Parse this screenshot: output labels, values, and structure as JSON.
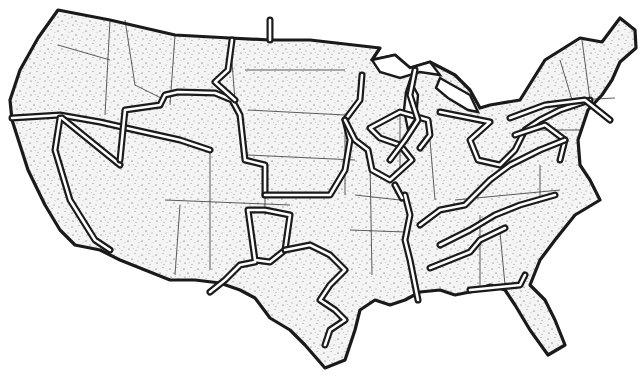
{
  "map": {
    "title": "",
    "style": "stippled black-and-white outline map",
    "subject": "contiguous United States with thick double-line regional boundaries",
    "colors": {
      "ink": "#1a1a1a",
      "paper": "#ffffff",
      "stipple": "#3a3a3a"
    },
    "width": 643,
    "height": 379,
    "states_outline": "M38 38 L58 10 L110 20 L175 35 L230 38 L270 40 L310 40 L380 48 L372 60 L395 55 L410 68 L430 62 L455 75 L470 90 L480 108 L490 105 L520 100 L545 60 L580 38 L602 42 L620 18 L635 30 L636 48 L620 62 L612 80 L602 95 L588 110 L578 140 L580 165 L590 180 L600 200 L575 215 L555 240 L540 260 L530 285 L545 300 L555 320 L565 345 L548 355 L530 330 L515 305 L505 290 L490 285 L470 292 L455 295 L440 290 L420 292 L405 300 L390 305 L375 300 L360 310 L355 330 L345 360 L325 368 L305 345 L290 330 L270 318 L255 298 L240 290 L220 283 L195 280 L170 280 L150 272 L120 260 L100 250 L75 245 L60 230 L45 205 L28 170 L12 120 L10 100 L20 70 Z",
    "regions": [
      {
        "name": "pacific-northwest-region",
        "path": "M12 118 L60 115 L100 122 L135 130 L180 140 L210 150"
      },
      {
        "name": "nevada-wedge-region",
        "path": "M60 118 L55 150 L70 200 L95 240 L110 250 M62 118 L120 165"
      },
      {
        "name": "rocky-mountain-region",
        "path": "M120 160 L125 110 L160 105 M160 105 L165 95 L178 92 L215 93 L232 100 L240 115 L245 160 L265 165 L265 195"
      },
      {
        "name": "northern-plains-region",
        "path": "M232 40 L228 70 L215 82 L235 100 M270 20 L270 40 M265 195 L330 195 L345 170 L350 140 L345 120 L360 100 L362 75"
      },
      {
        "name": "great-lakes-region",
        "path": "M345 120 L355 140 L368 150 L372 170 L390 180 L412 160 L400 145 L380 138 L370 128 L400 112 L428 120 L430 135 L420 148"
      },
      {
        "name": "michigan-lake-region",
        "path": "M415 70 L410 95 L418 120 L405 140 L390 160"
      },
      {
        "name": "ohio-valley-region",
        "path": "M440 112 L470 118 L490 122 L470 140 L478 160 L500 165 L515 150 L525 130 L540 120 L560 110 L590 100"
      },
      {
        "name": "northeast-region",
        "path": "M510 118 L545 105 L585 100 L600 112 L610 120 M515 135 L545 125 L565 140 L560 160"
      },
      {
        "name": "southern-plains-region",
        "path": "M248 210 L255 260 L270 262 L285 250 L290 215 L265 210 Z M255 262 L240 265 L225 280 L210 292"
      },
      {
        "name": "texas-river-region",
        "path": "M285 250 L310 245 L330 255 L345 270 L330 285 L320 300 L335 310 L345 320 L330 330 L325 345"
      },
      {
        "name": "mississippi-region",
        "path": "M405 195 L410 215 L405 240 L410 260 L415 285 L418 300 M395 185 L402 198"
      },
      {
        "name": "deep-south-region",
        "path": "M420 225 L440 210 L465 205 L490 180 L510 165 L540 150 L565 140 M440 245 L470 230 L495 215 L520 205 L555 195 M430 268 L455 258 L470 252 L480 240 L505 228 M470 290 L520 285 L525 275"
      }
    ],
    "lakes": [
      {
        "name": "lake-superior",
        "path": "M372 60 L395 55 L410 68 L430 62 L440 75 L420 72 L400 78 L380 72 Z"
      },
      {
        "name": "lake-michigan",
        "path": "M410 80 L418 95 L416 118 L408 130 L404 110 L406 92 Z"
      },
      {
        "name": "lake-erie-huron",
        "path": "M440 78 L470 95 L478 112 L468 110 L448 98 L436 88 Z"
      }
    ],
    "interior_state_lines": [
      "M110 20 L105 115",
      "M58 45 L110 60",
      "M125 20 L135 85 L165 100",
      "M175 35 L170 105",
      "M230 38 L235 100",
      "M245 70 L345 70",
      "M248 110 L345 115",
      "M248 155 L355 160",
      "M210 150 L210 270",
      "M165 200 L290 205",
      "M265 195 L265 215",
      "M180 205 L175 275",
      "M345 120 L345 195",
      "M355 195 L400 200",
      "M350 230 L405 232",
      "M370 160 L372 275",
      "M400 110 L400 175",
      "M430 140 L435 200",
      "M455 200 L560 190",
      "M480 215 L480 290",
      "M500 232 L505 285",
      "M540 165 L540 200",
      "M520 130 L580 130",
      "M560 60 L575 110",
      "M582 40 L590 100",
      "M575 100 L615 98"
    ]
  }
}
